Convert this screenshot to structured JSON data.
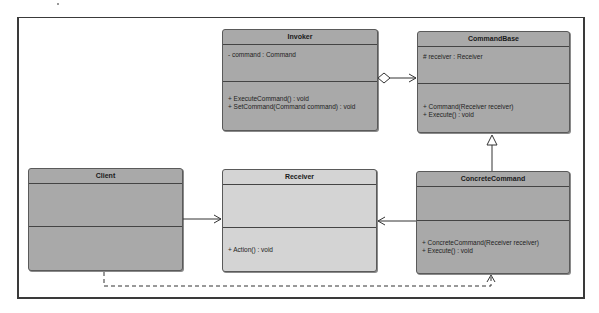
{
  "diagram": {
    "type": "UML class diagram",
    "pattern": "Command",
    "classes": [
      {
        "id": "invoker",
        "name": "Invoker",
        "attributes": [
          "- command : Command"
        ],
        "operations": [
          "+ ExecuteCommand() : void",
          "+ SetCommand(Command command) : void"
        ]
      },
      {
        "id": "command_base",
        "name": "CommandBase",
        "attributes": [
          "# receiver : Receiver"
        ],
        "operations": [
          "+ Command(Receiver receiver)",
          "+ Execute() : void"
        ]
      },
      {
        "id": "client",
        "name": "Client",
        "attributes": [],
        "operations": []
      },
      {
        "id": "receiver",
        "name": "Receiver",
        "attributes": [],
        "operations": [
          "+ Action() : void"
        ]
      },
      {
        "id": "concrete_command",
        "name": "ConcreteCommand",
        "attributes": [],
        "operations": [
          "+ ConcreteCommand(Receiver receiver)",
          "+ Execute() : void"
        ]
      }
    ],
    "relationships": [
      {
        "from": "Invoker",
        "to": "CommandBase",
        "type": "aggregation"
      },
      {
        "from": "ConcreteCommand",
        "to": "CommandBase",
        "type": "generalization"
      },
      {
        "from": "Client",
        "to": "Receiver",
        "type": "association"
      },
      {
        "from": "ConcreteCommand",
        "to": "Receiver",
        "type": "association"
      },
      {
        "from": "Client",
        "to": "ConcreteCommand",
        "type": "dependency"
      }
    ],
    "colors": {
      "class_fill": "#a9a9a9",
      "receiver_fill": "#d4d4d4",
      "border": "#444444",
      "line": "#333333"
    }
  }
}
